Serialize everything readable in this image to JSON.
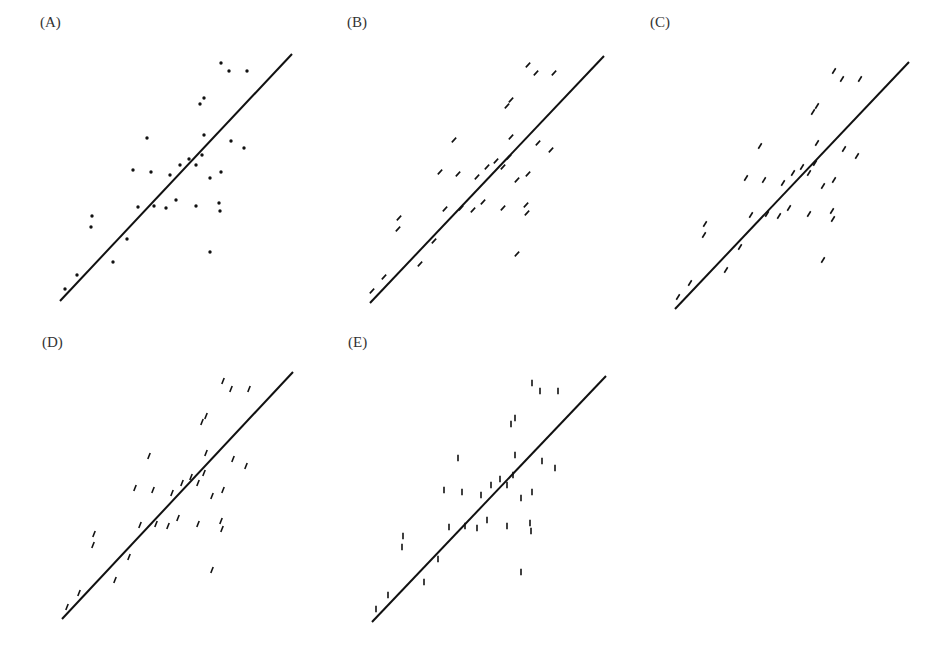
{
  "figure": {
    "colors": {
      "ink": "#111111",
      "label": "#333333",
      "background": "#ffffff"
    },
    "points": [
      [
        221,
        63
      ],
      [
        229,
        71
      ],
      [
        247,
        71
      ],
      [
        204,
        98
      ],
      [
        200,
        104
      ],
      [
        147,
        138
      ],
      [
        204,
        135
      ],
      [
        231,
        141
      ],
      [
        244,
        148
      ],
      [
        189,
        159
      ],
      [
        202,
        155
      ],
      [
        180,
        165
      ],
      [
        196,
        165
      ],
      [
        133,
        170
      ],
      [
        151,
        172
      ],
      [
        170,
        175
      ],
      [
        221,
        172
      ],
      [
        210,
        178
      ],
      [
        138,
        207
      ],
      [
        154,
        206
      ],
      [
        166,
        208
      ],
      [
        176,
        200
      ],
      [
        196,
        206
      ],
      [
        219,
        203
      ],
      [
        220,
        211
      ],
      [
        92,
        216
      ],
      [
        91,
        227
      ],
      [
        127,
        239
      ],
      [
        113,
        262
      ],
      [
        210,
        252
      ],
      [
        77,
        275
      ],
      [
        65,
        289
      ]
    ],
    "panels": [
      {
        "id": "A",
        "label": "(A)",
        "label_pos": [
          40,
          14
        ],
        "offset": [
          0,
          0
        ],
        "line": [
          [
            60,
            301
          ],
          [
            292,
            54
          ]
        ],
        "marker": "dot",
        "angle": 0
      },
      {
        "id": "B",
        "label": "(B)",
        "label_pos": [
          347,
          14
        ],
        "offset": [
          307,
          2
        ],
        "line": [
          [
            370,
            303
          ],
          [
            604,
            56
          ]
        ],
        "marker": "segment",
        "angle": -47
      },
      {
        "id": "C",
        "label": "(C)",
        "label_pos": [
          650,
          14
        ],
        "offset": [
          613,
          8
        ],
        "line": [
          [
            675,
            309
          ],
          [
            909,
            62
          ]
        ],
        "marker": "segment",
        "angle": -58
      },
      {
        "id": "D",
        "label": "(D)",
        "label_pos": [
          42,
          334
        ],
        "offset": [
          2,
          318
        ],
        "line": [
          [
            62,
            619
          ],
          [
            293,
            372
          ]
        ],
        "marker": "segment",
        "angle": -68
      },
      {
        "id": "E",
        "label": "(E)",
        "label_pos": [
          348,
          334
        ],
        "offset": [
          311,
          320
        ],
        "line": [
          [
            372,
            622
          ],
          [
            606,
            376
          ]
        ],
        "marker": "segment",
        "angle": -90
      }
    ]
  }
}
